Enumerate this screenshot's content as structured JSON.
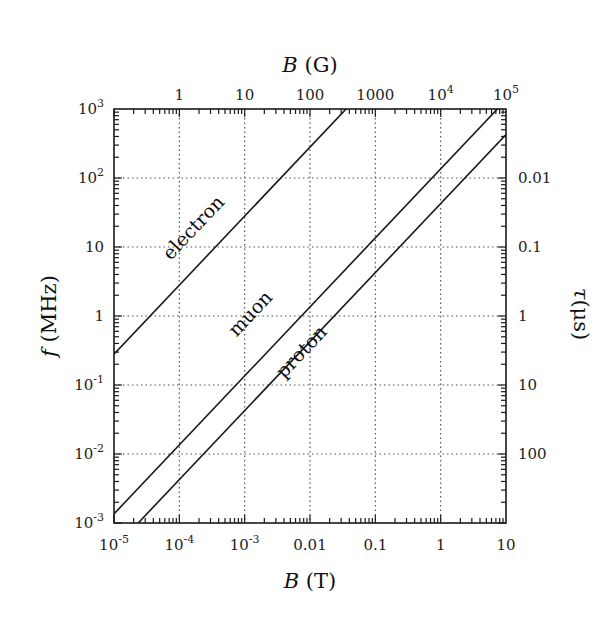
{
  "chart_data": {
    "type": "line",
    "title": "",
    "xscale": "log",
    "yscale": "log",
    "xlabel": "B (T)",
    "ylabel": "f (MHz)",
    "x2label": "B (G)",
    "y2label": "τ(μs)",
    "xlim": [
      1e-05,
      10
    ],
    "ylim": [
      0.001,
      1000
    ],
    "grid": true,
    "legend": "inline labels",
    "x_ticks": [
      {
        "value": 1e-05,
        "label": "10",
        "exp": "-5"
      },
      {
        "value": 0.0001,
        "label": "10",
        "exp": "-4"
      },
      {
        "value": 0.001,
        "label": "10",
        "exp": "-3"
      },
      {
        "value": 0.01,
        "label": "0.01",
        "exp": ""
      },
      {
        "value": 0.1,
        "label": "0.1",
        "exp": ""
      },
      {
        "value": 1,
        "label": "1",
        "exp": ""
      },
      {
        "value": 10,
        "label": "10",
        "exp": ""
      }
    ],
    "x2_ticks": [
      {
        "value": 0.0001,
        "label": "1",
        "exp": ""
      },
      {
        "value": 0.001,
        "label": "10",
        "exp": ""
      },
      {
        "value": 0.01,
        "label": "100",
        "exp": ""
      },
      {
        "value": 0.1,
        "label": "1000",
        "exp": ""
      },
      {
        "value": 1,
        "label": "10",
        "exp": "4"
      },
      {
        "value": 10,
        "label": "10",
        "exp": "5"
      }
    ],
    "y_ticks": [
      {
        "value": 0.001,
        "label": "10",
        "exp": "-3"
      },
      {
        "value": 0.01,
        "label": "10",
        "exp": "-2"
      },
      {
        "value": 0.1,
        "label": "10",
        "exp": "-1"
      },
      {
        "value": 1,
        "label": "1",
        "exp": ""
      },
      {
        "value": 10,
        "label": "10",
        "exp": ""
      },
      {
        "value": 100,
        "label": "10",
        "exp": "2"
      },
      {
        "value": 1000,
        "label": "10",
        "exp": "3"
      }
    ],
    "y2_ticks": [
      {
        "value": 100,
        "label": "0.01"
      },
      {
        "value": 10,
        "label": "0.1"
      },
      {
        "value": 1,
        "label": "1"
      },
      {
        "value": 0.1,
        "label": "10"
      },
      {
        "value": 0.01,
        "label": "100"
      }
    ],
    "series": [
      {
        "name": "electron",
        "slope_MHz_per_T": 28025,
        "x": [
          1e-05,
          0.0357
        ],
        "y": [
          0.28,
          1000
        ]
      },
      {
        "name": "muon",
        "slope_MHz_per_T": 135.5,
        "x": [
          1e-05,
          7.38
        ],
        "y": [
          0.001355,
          1000
        ]
      },
      {
        "name": "proton",
        "slope_MHz_per_T": 42.58,
        "x": [
          2.35e-05,
          10
        ],
        "y": [
          0.001,
          425.8
        ]
      }
    ],
    "line_color": "#1a1a1a",
    "grid_color": "#555555"
  }
}
